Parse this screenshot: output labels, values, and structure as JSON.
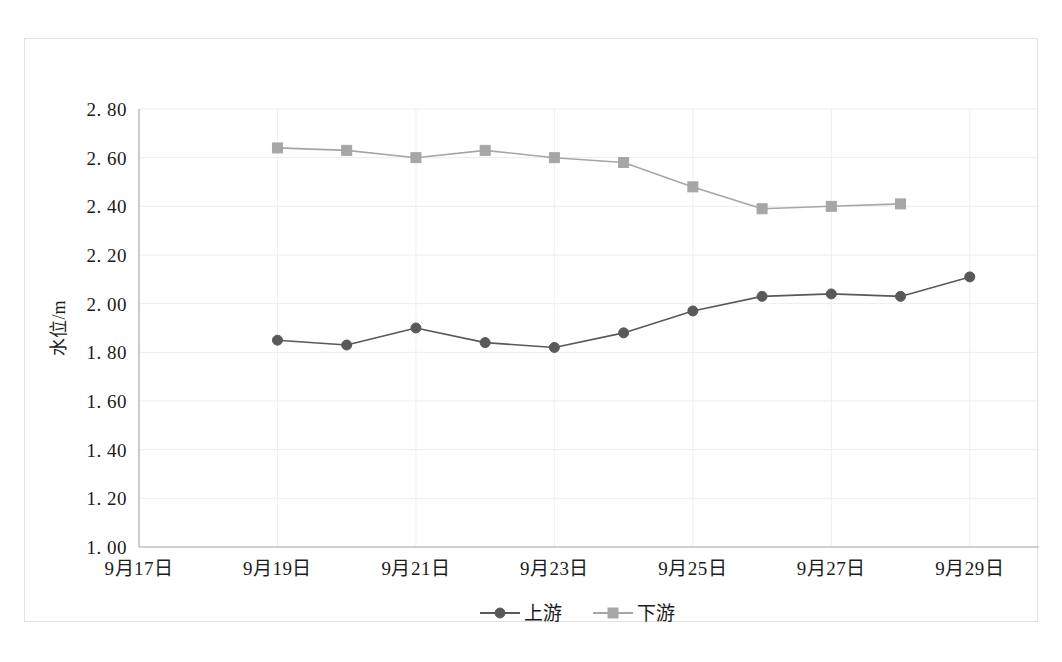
{
  "chart_data": {
    "type": "line",
    "title": "",
    "xlabel": "",
    "ylabel": "水位/m",
    "ylim": [
      1.0,
      2.8
    ],
    "ytick_step": 0.2,
    "ytick_labels": [
      "2. 80",
      "2. 60",
      "2. 40",
      "2. 20",
      "2. 00",
      "1. 80",
      "1. 60",
      "1. 40",
      "1. 20",
      "1. 00"
    ],
    "ytick_values": [
      2.8,
      2.6,
      2.4,
      2.2,
      2.0,
      1.8,
      1.6,
      1.4,
      1.2,
      1.0
    ],
    "xtick_labels": [
      "9月17日",
      "9月19日",
      "9月21日",
      "9月23日",
      "9月25日",
      "9月27日",
      "9月29日"
    ],
    "xtick_values": [
      17,
      19,
      21,
      23,
      25,
      27,
      29
    ],
    "xlim": [
      17,
      30
    ],
    "grid": true,
    "legend_position": "bottom",
    "categories": [
      17,
      18,
      19,
      20,
      21,
      22,
      23,
      24,
      25,
      26,
      27,
      28,
      29
    ],
    "series": [
      {
        "name": "上游",
        "marker": "circle",
        "color": "#595959",
        "x": [
          19,
          20,
          21,
          22,
          23,
          24,
          25,
          26,
          27,
          28,
          29
        ],
        "values": [
          1.85,
          1.83,
          1.9,
          1.84,
          1.82,
          1.88,
          1.97,
          2.03,
          2.04,
          2.03,
          2.11
        ]
      },
      {
        "name": "下游",
        "marker": "square",
        "color": "#a6a6a6",
        "x": [
          19,
          20,
          21,
          22,
          23,
          24,
          25,
          26,
          27,
          28
        ],
        "values": [
          2.64,
          2.63,
          2.6,
          2.63,
          2.6,
          2.58,
          2.48,
          2.39,
          2.4,
          2.41
        ]
      }
    ]
  },
  "legend": {
    "items": [
      {
        "label": "上游",
        "marker": "circle",
        "color": "#595959"
      },
      {
        "label": "下游",
        "marker": "square",
        "color": "#a6a6a6"
      }
    ]
  }
}
